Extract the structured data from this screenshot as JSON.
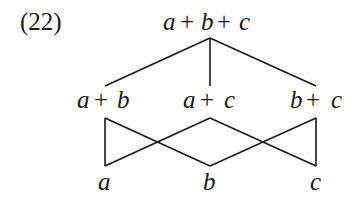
{
  "diagram": {
    "example_number": "(22)",
    "type": "lattice",
    "nodes": {
      "top": {
        "label_parts": [
          "a",
          "+",
          "b",
          "+",
          "c"
        ],
        "text": "a+b+c"
      },
      "ab": {
        "label_parts": [
          "a",
          "+",
          "b"
        ],
        "text": "a+b"
      },
      "ac": {
        "label_parts": [
          "a",
          "+",
          "c"
        ],
        "text": "a+c"
      },
      "bc": {
        "label_parts": [
          "b",
          "+",
          "c"
        ],
        "text": "b+c"
      },
      "a": {
        "text": "a"
      },
      "b": {
        "text": "b"
      },
      "c": {
        "text": "c"
      }
    },
    "edges": [
      [
        "a+b+c",
        "a+b"
      ],
      [
        "a+b+c",
        "a+c"
      ],
      [
        "a+b+c",
        "b+c"
      ],
      [
        "a+b",
        "a"
      ],
      [
        "a+b",
        "b"
      ],
      [
        "a+c",
        "a"
      ],
      [
        "a+c",
        "c"
      ],
      [
        "b+c",
        "b"
      ],
      [
        "b+c",
        "c"
      ]
    ],
    "colors": {
      "ink": "#1a1a1a",
      "background": "#ffffff"
    }
  }
}
